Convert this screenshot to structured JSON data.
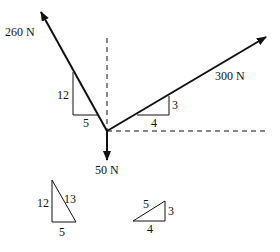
{
  "diagram": {
    "type": "free-body force diagram",
    "forces": [
      {
        "id": "f260",
        "label": "260 N",
        "direction": "up-left",
        "slope": {
          "rise": 12,
          "run": 5
        }
      },
      {
        "id": "f300",
        "label": "300 N",
        "direction": "up-right",
        "slope": {
          "rise": 3,
          "run": 4
        }
      },
      {
        "id": "f50",
        "label": "50 N",
        "direction": "down"
      }
    ],
    "slope_triangles": {
      "f260": {
        "vertical": "12",
        "horizontal": "5"
      },
      "f300": {
        "vertical": "3",
        "horizontal": "4"
      }
    },
    "reference_triangles": [
      {
        "id": "tri-5-12-13",
        "sides": {
          "vertical": "12",
          "hypotenuse": "13",
          "horizontal": "5"
        }
      },
      {
        "id": "tri-3-4-5",
        "sides": {
          "hypotenuse": "5",
          "vertical": "3",
          "horizontal": "4"
        }
      }
    ],
    "colors": {
      "stroke": "#111111",
      "background": "#ffffff"
    }
  }
}
